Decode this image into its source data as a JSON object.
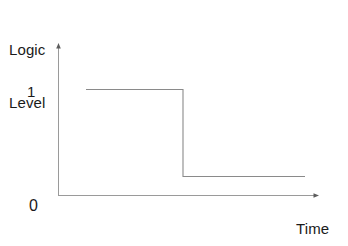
{
  "figure": {
    "background_color": "#ffffff",
    "ink_color": "#808080",
    "text_color": "#1a1a1a",
    "axis_y_title_line1": "Logic",
    "axis_y_title_line2": "Level",
    "axis_x_title": "Time",
    "tick_label_high": "1",
    "tick_label_low": "0"
  },
  "chart_data": {
    "type": "line",
    "title": "",
    "subtitle": "",
    "xlabel": "Time",
    "ylabel": "Logic Level",
    "grid": false,
    "legend": false,
    "legend_position": "none",
    "xlim": [
      0,
      1
    ],
    "ylim": [
      0,
      1.25
    ],
    "xticks": [],
    "xticklabels": [],
    "yticks": [
      0,
      1
    ],
    "yticklabels": [
      "0",
      "1"
    ],
    "axis_style": "arrow-tipped open axes",
    "annotations": [
      "Signal holds at logic level 1, then falls to a low level above 0 and stays there.",
      "Low state is drawn slightly above the 0 baseline, not at 0."
    ],
    "series": [
      {
        "name": "Logic signal",
        "color": "#8a8a8a",
        "x": [
          0.108,
          0.481,
          0.481,
          0.95
        ],
        "y": [
          1.0,
          1.0,
          0.126,
          0.126
        ],
        "step": "post"
      }
    ],
    "levels": {
      "high_value": 1.0,
      "low_value": 0.126,
      "transition_x": 0.481
    }
  },
  "geometry": {
    "origin_x": 58,
    "origin_y": 195,
    "y_axis_top": 44,
    "x_axis_right": 318,
    "high_level_y": 89,
    "low_level_y": 176,
    "signal_start_x": 86,
    "signal_end_x": 305,
    "edge_x": 183
  }
}
